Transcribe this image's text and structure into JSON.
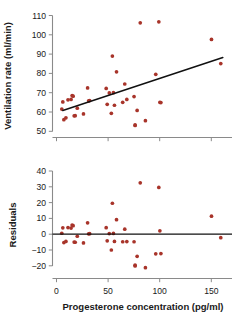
{
  "figure": {
    "title": "",
    "point_color": "#a8342a",
    "line_color": "#111111",
    "axis_color": "#8a8a8a"
  },
  "chart_data": [
    {
      "type": "scatter",
      "panel": "top",
      "title": "",
      "xlabel": "",
      "ylabel": "Ventilation rate (ml/min)",
      "xlim": [
        0,
        170
      ],
      "ylim": [
        50,
        110
      ],
      "xticks": [
        0,
        50,
        100,
        150
      ],
      "xticklabels": [
        "",
        "",
        "",
        ""
      ],
      "yticks": [
        50,
        60,
        70,
        80,
        90,
        100,
        110
      ],
      "yticklabels": [
        "50",
        "60",
        "70",
        "80",
        "90",
        "100",
        "110"
      ],
      "grid": false,
      "legend": "none",
      "x": [
        9,
        10,
        11,
        13,
        15,
        18,
        19,
        20,
        21,
        22,
        24,
        30,
        34,
        35,
        36,
        52,
        53,
        55,
        57,
        58,
        59,
        60,
        62,
        68,
        70,
        72,
        79,
        80,
        80,
        82,
        85,
        90,
        100,
        103,
        104,
        105,
        154,
        163
      ],
      "y": [
        61.5,
        65.2,
        56.0,
        57.0,
        66.3,
        66.5,
        68.5,
        68.2,
        58.0,
        58.1,
        62.0,
        59.0,
        72.5,
        65.8,
        65.9,
        72.2,
        64.0,
        69.9,
        59.3,
        89.0,
        70.0,
        63.5,
        80.8,
        65.0,
        74.5,
        66.5,
        68.0,
        53.3,
        53.0,
        60.8,
        106.2,
        55.5,
        79.5,
        106.7,
        65.0,
        64.9,
        97.6,
        85.1
      ],
      "fit_line": {
        "label": "linear regression fit",
        "x": [
          10,
          165
        ],
        "y": [
          60.8,
          88.2
        ]
      }
    },
    {
      "type": "scatter",
      "panel": "bottom",
      "title": "",
      "xlabel": "Progesterone concentration (pg/ml)",
      "ylabel": "Residuals",
      "xlim": [
        0,
        170
      ],
      "ylim": [
        -24,
        40
      ],
      "xticks": [
        0,
        50,
        100,
        150
      ],
      "xticklabels": [
        "0",
        "50",
        "100",
        "150"
      ],
      "yticks": [
        -20,
        -10,
        0,
        10,
        20,
        30,
        40
      ],
      "yticklabels": [
        "−20",
        "−10",
        "0",
        "10",
        "20",
        "30",
        "40"
      ],
      "grid": false,
      "legend": "none",
      "x": [
        9,
        10,
        11,
        13,
        15,
        18,
        19,
        20,
        21,
        22,
        24,
        30,
        34,
        35,
        36,
        52,
        53,
        55,
        57,
        58,
        59,
        60,
        62,
        68,
        70,
        72,
        79,
        80,
        80,
        82,
        85,
        90,
        100,
        103,
        104,
        105,
        154,
        163
      ],
      "y": [
        0.6,
        4.0,
        -5.3,
        -4.6,
        4.2,
        3.9,
        5.8,
        5.4,
        -5.0,
        -5.1,
        -1.3,
        -5.5,
        7.2,
        0.2,
        0.3,
        4.1,
        -4.2,
        0.4,
        -10.0,
        19.6,
        0.5,
        -4.6,
        9.2,
        -4.8,
        3.2,
        -4.7,
        -4.8,
        -19.6,
        -20.1,
        -14.0,
        32.5,
        -21.2,
        -12.4,
        29.6,
        2.1,
        -12.3,
        11.4,
        -2.2
      ],
      "zero_line": {
        "label": "zero residual reference line",
        "y": 0
      }
    }
  ]
}
